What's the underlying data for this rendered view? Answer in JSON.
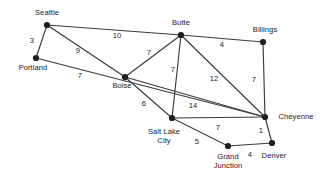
{
  "figure": {
    "background_color": "#ffffff",
    "edge_color": "#3a3a3f",
    "node_color": "#1d1d20",
    "text_color": "#1a1a1c",
    "width": 325,
    "height": 184
  },
  "chart_data": {
    "type": "diagram",
    "subtype": "weighted-undirected-graph",
    "title": "",
    "nodes": [
      {
        "id": "seattle",
        "label": "Seattle",
        "x": 47,
        "y": 25,
        "label_x": 47,
        "label_y": 9,
        "label_lines": [
          "Seattle"
        ]
      },
      {
        "id": "portland",
        "label": "Portland",
        "x": 36,
        "y": 58,
        "label_x": 33,
        "label_y": 64,
        "label_lines": [
          "Portland"
        ]
      },
      {
        "id": "boise",
        "label": "Boise",
        "x": 125,
        "y": 77,
        "label_x": 122,
        "label_y": 82,
        "label_lines": [
          "Boise"
        ]
      },
      {
        "id": "butte",
        "label": "Butte",
        "x": 181,
        "y": 35,
        "label_x": 181,
        "label_y": 19,
        "label_lines": [
          "Butte"
        ]
      },
      {
        "id": "billings",
        "label": "Billings",
        "x": 263,
        "y": 42,
        "label_x": 265,
        "label_y": 26,
        "label_lines": [
          "Billings"
        ]
      },
      {
        "id": "cheyenne",
        "label": "Cheyenne",
        "x": 265,
        "y": 117,
        "label_x": 296,
        "label_y": 113,
        "label_lines": [
          "Cheyenne"
        ]
      },
      {
        "id": "salt-lake-city",
        "label": "Salt Lake City",
        "x": 172,
        "y": 118,
        "label_x": 164,
        "label_y": 127,
        "label_lines": [
          "Salt Lake",
          "City"
        ]
      },
      {
        "id": "grand-junction",
        "label": "Grand Junction",
        "x": 228,
        "y": 146,
        "label_x": 228,
        "label_y": 152,
        "label_lines": [
          "Grand",
          "Junction"
        ]
      },
      {
        "id": "denver",
        "label": "Denver",
        "x": 272,
        "y": 143,
        "label_x": 274,
        "label_y": 152,
        "label_lines": [
          "Denver"
        ]
      }
    ],
    "edges": [
      {
        "id": "seattle-portland",
        "from": "seattle",
        "to": "portland",
        "weight": 3,
        "label_x": 32,
        "label_y": 41
      },
      {
        "id": "seattle-boise",
        "from": "seattle",
        "to": "boise",
        "weight": 9,
        "label_x": 78,
        "label_y": 51
      },
      {
        "id": "seattle-butte",
        "from": "seattle",
        "to": "butte",
        "weight": 10,
        "label_x": 117,
        "label_y": 36
      },
      {
        "id": "portland-cheyenne",
        "from": "portland",
        "to": "cheyenne",
        "weight": 7,
        "label_x": 80,
        "label_y": 76
      },
      {
        "id": "boise-butte",
        "from": "boise",
        "to": "butte",
        "weight": 7,
        "label_x": 149,
        "label_y": 53
      },
      {
        "id": "boise-salt-lake-city",
        "from": "boise",
        "to": "salt-lake-city",
        "weight": 6,
        "label_x": 144,
        "label_y": 104
      },
      {
        "id": "boise-cheyenne",
        "from": "boise",
        "to": "cheyenne",
        "weight": 14,
        "label_x": 193,
        "label_y": 106
      },
      {
        "id": "butte-billings",
        "from": "butte",
        "to": "billings",
        "weight": 4,
        "label_x": 222,
        "label_y": 45
      },
      {
        "id": "butte-salt-lake-city",
        "from": "butte",
        "to": "salt-lake-city",
        "weight": 7,
        "label_x": 173,
        "label_y": 70
      },
      {
        "id": "butte-cheyenne",
        "from": "butte",
        "to": "cheyenne",
        "weight": 12,
        "label_x": 214,
        "label_y": 79
      },
      {
        "id": "billings-cheyenne",
        "from": "billings",
        "to": "cheyenne",
        "weight": 7,
        "label_x": 254,
        "label_y": 80
      },
      {
        "id": "salt-lake-city-cheyenne",
        "from": "salt-lake-city",
        "to": "cheyenne",
        "weight": 7,
        "label_x": 218,
        "label_y": 128
      },
      {
        "id": "salt-lake-city-grand-junction",
        "from": "salt-lake-city",
        "to": "grand-junction",
        "weight": 5,
        "label_x": 197,
        "label_y": 142
      },
      {
        "id": "cheyenne-denver",
        "from": "cheyenne",
        "to": "denver",
        "weight": 1,
        "label_x": 261,
        "label_y": 131
      },
      {
        "id": "grand-junction-denver",
        "from": "grand-junction",
        "to": "denver",
        "weight": 4,
        "label_x": 250,
        "label_y": 155
      }
    ]
  }
}
